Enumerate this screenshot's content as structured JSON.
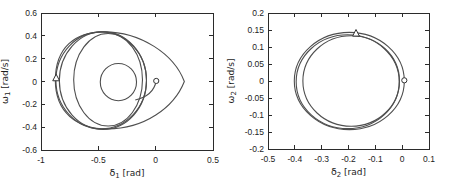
{
  "figure": {
    "background": "#ffffff",
    "line_color": "#4f4f4f",
    "axis_color": "#2b2b2b",
    "text_color": "#1c1c1c",
    "marker_color": "#333333"
  },
  "chart_data": [
    {
      "type": "line",
      "name": "phase-portrait-generator-1",
      "title": "",
      "xlabel": {
        "symbol": "δ",
        "sub": "1",
        "unit": "[rad]"
      },
      "ylabel": {
        "symbol": "ω",
        "sub": "1",
        "unit": "[rad/s]"
      },
      "xlim": [
        -1,
        0.5
      ],
      "ylim": [
        -0.6,
        0.6
      ],
      "xticks": [
        -1,
        -0.5,
        0,
        0.5
      ],
      "yticks": [
        0.6,
        0.4,
        0.2,
        0,
        -0.2,
        -0.4,
        -0.6
      ],
      "grid": false,
      "box_on": true,
      "trajectory": {
        "loops": [
          {
            "cx": -0.475,
            "cy": 0.01,
            "rx": 0.395,
            "ry": 0.425
          },
          {
            "cx": -0.46,
            "cy": 0.008,
            "rx": 0.38,
            "ry": 0.428
          },
          {
            "cx": -0.415,
            "cy": 0.015,
            "rx": 0.3,
            "ry": 0.405
          },
          {
            "cx": -0.325,
            "cy": -0.005,
            "rx": 0.158,
            "ry": 0.163
          }
        ],
        "egg": [
          [
            0.25,
            0
          ],
          [
            0.16,
            0.24
          ],
          [
            -0.13,
            0.435
          ],
          [
            -0.45,
            0.435
          ],
          [
            -0.7,
            0.435
          ],
          [
            -0.875,
            0.3
          ],
          [
            -0.875,
            0.01
          ],
          [
            -0.875,
            -0.27
          ],
          [
            -0.69,
            -0.415
          ],
          [
            -0.42,
            -0.415
          ],
          [
            -0.1,
            -0.415
          ],
          [
            0.16,
            -0.23
          ],
          [
            0.25,
            0
          ]
        ],
        "tail": [
          [
            0.005,
            0.005
          ],
          [
            -0.01,
            -0.075
          ],
          [
            -0.06,
            -0.135
          ],
          [
            -0.178,
            -0.162
          ]
        ]
      },
      "markers": [
        {
          "shape": "circle",
          "x": 0.005,
          "y": 0.005
        },
        {
          "shape": "triangle",
          "x": -0.868,
          "y": 0.03
        }
      ]
    },
    {
      "type": "line",
      "name": "phase-portrait-generator-2",
      "title": "",
      "xlabel": {
        "symbol": "δ",
        "sub": "2",
        "unit": "[rad]"
      },
      "ylabel": {
        "symbol": "ω",
        "sub": "2",
        "unit": "[rad/s]"
      },
      "xlim": [
        -0.5,
        0.1
      ],
      "ylim": [
        -0.2,
        0.2
      ],
      "xticks": [
        -0.5,
        -0.4,
        -0.3,
        -0.2,
        -0.1,
        0,
        0.1
      ],
      "yticks": [
        0.2,
        0.15,
        0.1,
        0.05,
        0,
        -0.05,
        -0.1,
        -0.15,
        -0.2
      ],
      "grid": false,
      "box_on": true,
      "trajectory": {
        "loops": [
          {
            "cx": -0.197,
            "cy": 0.0,
            "rx": 0.205,
            "ry": 0.143
          },
          {
            "cx": -0.203,
            "cy": -0.002,
            "rx": 0.192,
            "ry": 0.138
          },
          {
            "cx": -0.19,
            "cy": 0.0,
            "rx": 0.18,
            "ry": 0.133
          }
        ],
        "egg": null,
        "tail": null
      },
      "markers": [
        {
          "shape": "circle",
          "x": 0.008,
          "y": 0.002
        },
        {
          "shape": "triangle",
          "x": -0.172,
          "y": 0.14
        }
      ]
    }
  ]
}
